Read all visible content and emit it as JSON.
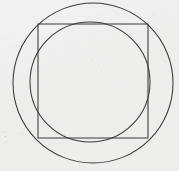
{
  "figure": {
    "background_color": "#f3f2f0",
    "stroke_color": "#3a3a3c",
    "stroke_width": 1.05,
    "canvas": {
      "width": 179,
      "height": 171
    },
    "shapes": [
      {
        "id": "outer-circle",
        "type": "circle",
        "label": "Outer circle (circumscribes the square)",
        "cx": 93,
        "cy": 83,
        "r": 80
      },
      {
        "id": "square",
        "type": "rect",
        "label": "Square",
        "x": 38,
        "y": 24,
        "width": 110,
        "height": 114
      },
      {
        "id": "inner-circle",
        "type": "circle",
        "label": "Inner circle (approximately inscribed in the square)",
        "cx": 90,
        "cy": 82,
        "r": 60
      }
    ],
    "artifacts": [
      {
        "id": "speck-left",
        "x": 4,
        "y": 131,
        "size": 1.4
      },
      {
        "id": "speck-left-lower",
        "x": 5,
        "y": 136,
        "size": 1.1
      },
      {
        "id": "speck-mid",
        "x": 92,
        "y": 59,
        "size": 1.2
      }
    ]
  }
}
